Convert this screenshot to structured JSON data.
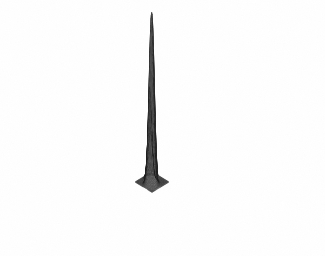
{
  "figure": {
    "kind": "3d-wireframe-surface-plot",
    "title": "",
    "caption": "",
    "background_color": "#ffffff",
    "line_color": "#1a1a1a",
    "fill_color": "#ffffff",
    "render_style": "hidden-line-removed mesh",
    "media": "scanned monochrome page figure"
  },
  "ghost_text": {
    "note": "faint reversed bleed-through text from the opposite side of the scanned page; illegible",
    "lines": [
      {
        "text": "the mesh surface of a bivariate",
        "x": 18,
        "y": 6,
        "size": 11
      },
      {
        "text": "function shown as a perspective",
        "x": 10,
        "y": 22,
        "size": 11
      },
      {
        "text": "plot with hidden lines removed",
        "x": 34,
        "y": 38,
        "size": 11
      },
      {
        "text": "for the two component peaks",
        "x": 60,
        "y": 54,
        "size": 11
      },
      {
        "text": "surface",
        "x": 120,
        "y": 88,
        "size": 11
      },
      {
        "text": "and",
        "x": 240,
        "y": 100,
        "size": 10
      },
      {
        "text": "mesh plot example",
        "x": 70,
        "y": 232,
        "size": 11
      }
    ]
  },
  "chart_data": {
    "type": "surface",
    "title": "",
    "xlabel": "",
    "ylabel": "",
    "zlabel": "",
    "grid": false,
    "axes_visible": false,
    "tick_labels": [],
    "legend": null,
    "legend_position": "none",
    "mesh": {
      "nx": 49,
      "ny": 49,
      "xlim": [
        -3,
        3
      ],
      "ylim": [
        -3,
        3
      ],
      "zlim": [
        0,
        1.05
      ]
    },
    "projection": {
      "type": "oblique-parallel",
      "azimuth_deg": -37.5,
      "elevation_deg": 30,
      "screen_origin": [
        152,
        182
      ],
      "x_axis_screen_vector": [
        2.82,
        1.72
      ],
      "y_axis_screen_vector": [
        2.82,
        -1.72
      ],
      "z_axis_screen_pixels": -172
    },
    "surface_function": "sum of two gaussian bumps on a flat zero base",
    "peaks": [
      {
        "name": "tall-peak",
        "amplitude": 1.0,
        "center_x": 0.62,
        "center_y": -0.72,
        "sigma_x": 0.62,
        "sigma_y": 0.62,
        "screen_apex": [
          200,
          20
        ]
      },
      {
        "name": "short-peak",
        "amplitude": 0.54,
        "center_x": -1.08,
        "center_y": 0.52,
        "sigma_x": 0.52,
        "sigma_y": 0.52,
        "screen_apex": [
          118,
          114
        ]
      }
    ],
    "base_plane_screen_corners": {
      "left": [
        17,
        161
      ],
      "front": [
        115,
        245
      ],
      "right": [
        288,
        163
      ],
      "back": [
        186,
        84
      ]
    },
    "series": [
      {
        "name": "z = f(x,y)",
        "description": "two-peak gaussian mixture evaluated on a 49x49 grid over [-3,3]x[-3,3]",
        "z_min": 0.0,
        "z_max": 1.0
      }
    ]
  }
}
